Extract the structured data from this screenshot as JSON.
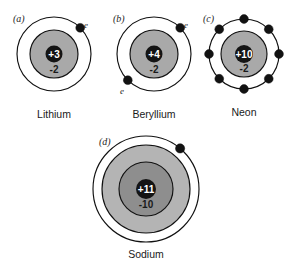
{
  "figure": {
    "title": "",
    "background_color": "#ffffff",
    "width": 292,
    "height": 267,
    "ink_color": "#121212",
    "shade_color": "#a9a9a9",
    "nucleus_fill": "#141414",
    "nucleus_text_color": "#ffffff"
  },
  "atoms": [
    {
      "panel_label": "(a)",
      "element_name": "Lithium",
      "nucleus_charge": "+3",
      "inner_shell_charge": "-2",
      "electron_labels": [
        "e"
      ],
      "shell_count": 2,
      "outer_electron_count": 1,
      "outer_electron_angles_deg": [
        45
      ]
    },
    {
      "panel_label": "(b)",
      "element_name": "Beryllium",
      "nucleus_charge": "+4",
      "inner_shell_charge": "-2",
      "electron_labels": [
        "e",
        "e"
      ],
      "shell_count": 2,
      "outer_electron_count": 2,
      "outer_electron_angles_deg": [
        45,
        225
      ]
    },
    {
      "panel_label": "(c)",
      "element_name": "Neon",
      "nucleus_charge": "+10",
      "inner_shell_charge": "-2",
      "electron_labels": [],
      "shell_count": 2,
      "outer_electron_count": 8,
      "outer_electron_angles_deg": [
        0,
        45,
        90,
        135,
        180,
        225,
        270,
        315
      ]
    },
    {
      "panel_label": "(d)",
      "element_name": "Sodium",
      "nucleus_charge": "+11",
      "inner_shell_charge": "-10",
      "electron_labels": [],
      "shell_count": 3,
      "outer_electron_count": 1,
      "outer_electron_angles_deg": [
        50
      ]
    }
  ]
}
